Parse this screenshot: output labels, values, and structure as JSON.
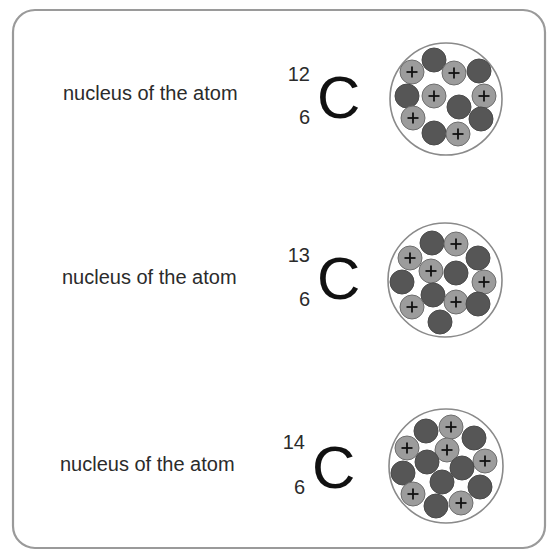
{
  "diagram": {
    "frame": {
      "x": 13,
      "y": 10,
      "w": 532,
      "h": 538,
      "rx": 22,
      "stroke": "#9a9a9a"
    },
    "colors": {
      "proton": "#9c9c9c",
      "proton_stroke": "#6e6e6e",
      "neutron": "#565656",
      "neutron_stroke": "#4a4a4a",
      "nucleus_outline": "#8a8a8a",
      "text": "#2b2b2b"
    },
    "particle_radius": 12,
    "rows": [
      {
        "label": "nucleus of the atom",
        "label_pos": {
          "x": 63,
          "y": 100
        },
        "mass_number": "12",
        "atomic_number": "6",
        "symbol": "C",
        "mass_pos": {
          "x": 310,
          "y": 81
        },
        "atomic_pos": {
          "x": 310,
          "y": 124
        },
        "symbol_pos": {
          "x": 317,
          "y": 118
        },
        "nucleus": {
          "cx": 446,
          "cy": 99,
          "r": 56
        },
        "protons": 6,
        "neutrons": 6,
        "particles": [
          {
            "type": "neutron",
            "x": 434,
            "y": 60
          },
          {
            "type": "proton",
            "x": 412,
            "y": 72
          },
          {
            "type": "proton",
            "x": 454,
            "y": 73
          },
          {
            "type": "neutron",
            "x": 479,
            "y": 71
          },
          {
            "type": "neutron",
            "x": 407,
            "y": 96
          },
          {
            "type": "proton",
            "x": 434,
            "y": 96
          },
          {
            "type": "proton",
            "x": 484,
            "y": 96
          },
          {
            "type": "neutron",
            "x": 459,
            "y": 107
          },
          {
            "type": "proton",
            "x": 413,
            "y": 118
          },
          {
            "type": "neutron",
            "x": 481,
            "y": 119
          },
          {
            "type": "neutron",
            "x": 434,
            "y": 133
          },
          {
            "type": "proton",
            "x": 458,
            "y": 134
          }
        ]
      },
      {
        "label": "nucleus of the atom",
        "label_pos": {
          "x": 62,
          "y": 284
        },
        "mass_number": "13",
        "atomic_number": "6",
        "symbol": "C",
        "mass_pos": {
          "x": 310,
          "y": 262
        },
        "atomic_pos": {
          "x": 310,
          "y": 306
        },
        "symbol_pos": {
          "x": 317,
          "y": 299
        },
        "nucleus": {
          "cx": 445,
          "cy": 280,
          "r": 57
        },
        "protons": 6,
        "neutrons": 7,
        "particles": [
          {
            "type": "neutron",
            "x": 432,
            "y": 243
          },
          {
            "type": "proton",
            "x": 456,
            "y": 244
          },
          {
            "type": "proton",
            "x": 410,
            "y": 258
          },
          {
            "type": "neutron",
            "x": 478,
            "y": 258
          },
          {
            "type": "proton",
            "x": 431,
            "y": 271
          },
          {
            "type": "neutron",
            "x": 456,
            "y": 273
          },
          {
            "type": "neutron",
            "x": 402,
            "y": 282
          },
          {
            "type": "proton",
            "x": 484,
            "y": 282
          },
          {
            "type": "neutron",
            "x": 433,
            "y": 295
          },
          {
            "type": "proton",
            "x": 412,
            "y": 307
          },
          {
            "type": "proton",
            "x": 456,
            "y": 302
          },
          {
            "type": "neutron",
            "x": 478,
            "y": 304
          },
          {
            "type": "neutron",
            "x": 440,
            "y": 322
          }
        ]
      },
      {
        "label": "nucleus of the atom",
        "label_pos": {
          "x": 60,
          "y": 471
        },
        "mass_number": "14",
        "atomic_number": "6",
        "symbol": "C",
        "mass_pos": {
          "x": 305,
          "y": 449
        },
        "atomic_pos": {
          "x": 305,
          "y": 494
        },
        "symbol_pos": {
          "x": 312,
          "y": 488
        },
        "nucleus": {
          "cx": 446,
          "cy": 466,
          "r": 57
        },
        "protons": 6,
        "neutrons": 8,
        "particles": [
          {
            "type": "neutron",
            "x": 426,
            "y": 431
          },
          {
            "type": "proton",
            "x": 451,
            "y": 427
          },
          {
            "type": "neutron",
            "x": 474,
            "y": 438
          },
          {
            "type": "proton",
            "x": 407,
            "y": 448
          },
          {
            "type": "proton",
            "x": 447,
            "y": 450
          },
          {
            "type": "neutron",
            "x": 427,
            "y": 462
          },
          {
            "type": "proton",
            "x": 485,
            "y": 461
          },
          {
            "type": "neutron",
            "x": 403,
            "y": 473
          },
          {
            "type": "neutron",
            "x": 462,
            "y": 468
          },
          {
            "type": "neutron",
            "x": 442,
            "y": 482
          },
          {
            "type": "neutron",
            "x": 480,
            "y": 487
          },
          {
            "type": "proton",
            "x": 413,
            "y": 494
          },
          {
            "type": "neutron",
            "x": 436,
            "y": 506
          },
          {
            "type": "proton",
            "x": 461,
            "y": 503
          }
        ]
      }
    ],
    "proton_symbol": "+"
  }
}
